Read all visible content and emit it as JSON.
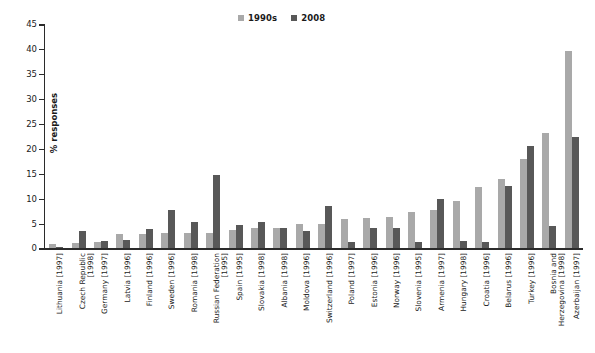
{
  "chart_data": {
    "type": "bar",
    "title": "",
    "xlabel": "",
    "ylabel": "% responses",
    "ylim": [
      0,
      45
    ],
    "ytick_step": 5,
    "yticks": [
      "0",
      "5",
      "10",
      "15",
      "20",
      "25",
      "30",
      "35",
      "40",
      "45"
    ],
    "grid": false,
    "legend_position": "top-center",
    "colors": {
      "series_1990s": "#a9a9a9",
      "series_2008": "#585858",
      "axis": "#2b2b2b",
      "text": "#1a1a1a",
      "background": "#ffffff"
    },
    "categories": [
      "Lithuania [1997]",
      "Czech Republic\n[1998]",
      "Germany [1997]",
      "Latvia [1996]",
      "Finland [1996]",
      "Sweden [1996]",
      "Romania [1998]",
      "Russian Federation\n[1995]",
      "Spain [1995]",
      "Slovakia [1998]",
      "Albania [1998]",
      "Moldova [1996]",
      "Switzerland [1996]",
      "Poland [1997]",
      "Estonia [1996]",
      "Norway [1996]",
      "Slovenia [1995]",
      "Armenia [1997]",
      "Hungary [1998]",
      "Croatia [1996]",
      "Belarus [1996]",
      "Turkey [1996]",
      "Bosnia and\nHerzegovina [1998]",
      "Azerbaijan [1997]"
    ],
    "series": [
      {
        "name": "1990s",
        "color": "#a9a9a9",
        "values": [
          0.9,
          1.1,
          1.2,
          2.8,
          2.8,
          3.0,
          3.1,
          3.1,
          3.7,
          4.1,
          4.1,
          4.9,
          5.0,
          6.0,
          6.2,
          6.4,
          7.3,
          7.8,
          9.5,
          12.4,
          14.0,
          18.0,
          23.1,
          39.7
        ]
      },
      {
        "name": "2008",
        "color": "#585858",
        "values": [
          0.2,
          3.5,
          1.5,
          1.7,
          3.9,
          7.7,
          5.4,
          14.7,
          4.7,
          5.3,
          4.1,
          3.5,
          8.5,
          1.3,
          4.2,
          4.2,
          1.3,
          10.0,
          1.5,
          1.3,
          12.5,
          20.5,
          4.5,
          22.4
        ]
      }
    ],
    "legend": [
      {
        "label": "1990s",
        "color": "#a9a9a9"
      },
      {
        "label": "2008",
        "color": "#585858"
      }
    ]
  }
}
